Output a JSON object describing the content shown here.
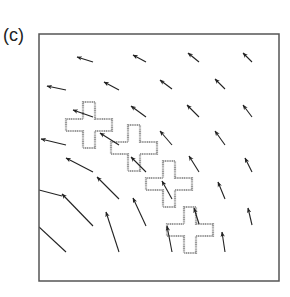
{
  "figure": {
    "panel_label": "(c)",
    "frame": {
      "x": 39,
      "y": 34,
      "width": 240,
      "height": 247,
      "stroke": "#555555"
    },
    "arrow_color": "#222222",
    "cross_style": {
      "outline": "#9a9a9a",
      "fill": "#ffffff",
      "arm_width": 12,
      "span": 46
    },
    "crosses": [
      {
        "cx": 89,
        "cy": 125
      },
      {
        "cx": 134,
        "cy": 148
      },
      {
        "cx": 169,
        "cy": 184
      },
      {
        "cx": 190,
        "cy": 230
      }
    ],
    "arrows": [
      {
        "x1": 93,
        "y1": 62,
        "x2": 77,
        "y2": 57
      },
      {
        "x1": 146,
        "y1": 62,
        "x2": 133,
        "y2": 55
      },
      {
        "x1": 199,
        "y1": 62,
        "x2": 188,
        "y2": 53
      },
      {
        "x1": 252,
        "y1": 62,
        "x2": 243,
        "y2": 53
      },
      {
        "x1": 66,
        "y1": 90,
        "x2": 47,
        "y2": 86
      },
      {
        "x1": 119,
        "y1": 90,
        "x2": 104,
        "y2": 82
      },
      {
        "x1": 172,
        "y1": 89,
        "x2": 160,
        "y2": 80
      },
      {
        "x1": 225,
        "y1": 89,
        "x2": 215,
        "y2": 79
      },
      {
        "x1": 93,
        "y1": 117,
        "x2": 73,
        "y2": 110
      },
      {
        "x1": 146,
        "y1": 117,
        "x2": 131,
        "y2": 106
      },
      {
        "x1": 199,
        "y1": 117,
        "x2": 187,
        "y2": 105
      },
      {
        "x1": 252,
        "y1": 117,
        "x2": 243,
        "y2": 105
      },
      {
        "x1": 66,
        "y1": 145,
        "x2": 41,
        "y2": 139
      },
      {
        "x1": 119,
        "y1": 145,
        "x2": 100,
        "y2": 133
      },
      {
        "x1": 172,
        "y1": 145,
        "x2": 160,
        "y2": 131
      },
      {
        "x1": 225,
        "y1": 145,
        "x2": 215,
        "y2": 131
      },
      {
        "x1": 93,
        "y1": 172,
        "x2": 66,
        "y2": 158
      },
      {
        "x1": 146,
        "y1": 172,
        "x2": 131,
        "y2": 157
      },
      {
        "x1": 199,
        "y1": 172,
        "x2": 189,
        "y2": 156
      },
      {
        "x1": 252,
        "y1": 172,
        "x2": 245,
        "y2": 158
      },
      {
        "x1": 119,
        "y1": 199,
        "x2": 97,
        "y2": 177
      },
      {
        "x1": 172,
        "y1": 199,
        "x2": 162,
        "y2": 181
      },
      {
        "x1": 225,
        "y1": 199,
        "x2": 218,
        "y2": 182
      },
      {
        "x1": 93,
        "y1": 226,
        "x2": 62,
        "y2": 194
      },
      {
        "x1": 146,
        "y1": 226,
        "x2": 133,
        "y2": 198
      },
      {
        "x1": 199,
        "y1": 224,
        "x2": 194,
        "y2": 208
      },
      {
        "x1": 252,
        "y1": 225,
        "x2": 248,
        "y2": 208
      },
      {
        "x1": 119,
        "y1": 252,
        "x2": 106,
        "y2": 212
      },
      {
        "x1": 172,
        "y1": 252,
        "x2": 167,
        "y2": 226
      },
      {
        "x1": 225,
        "y1": 252,
        "x2": 222,
        "y2": 232
      }
    ],
    "clipped_lines": [
      {
        "x1": 39,
        "y1": 190,
        "x2": 62,
        "y2": 196
      },
      {
        "x1": 39,
        "y1": 227,
        "x2": 66,
        "y2": 252
      }
    ]
  }
}
